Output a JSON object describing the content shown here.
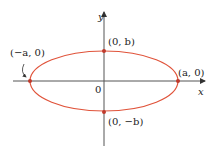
{
  "diagram": {
    "axes": {
      "x_label": "x",
      "y_label": "y",
      "origin_label": "0"
    },
    "ellipse_color": "#e0533a",
    "point_color": "#c0392b",
    "points": {
      "left": "(−a, 0)",
      "right": "(a, 0)",
      "top": "(0, b)",
      "bottom": "(0, −b)"
    }
  }
}
